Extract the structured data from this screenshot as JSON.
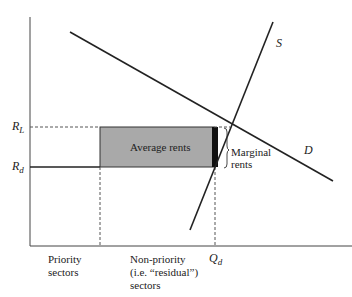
{
  "diagram": {
    "y_labels": {
      "r_l": "R",
      "r_l_sub": "L",
      "r_d": "R",
      "r_d_sub": "d"
    },
    "curve_labels": {
      "supply": "S",
      "demand": "D"
    },
    "box_label": "Average rents",
    "marginal_label_1": "Marginal",
    "marginal_label_2": "rents",
    "x_labels": {
      "priority_1": "Priority",
      "priority_2": "sectors",
      "nonpriority_1": "Non-priority",
      "nonpriority_2": "(i.e. “residual”)",
      "nonpriority_3": "sectors",
      "q": "Q",
      "q_sub": "d"
    },
    "colors": {
      "box_fill": "#a9a9a9",
      "line": "#222222",
      "marginal_bar": "#111111"
    }
  }
}
